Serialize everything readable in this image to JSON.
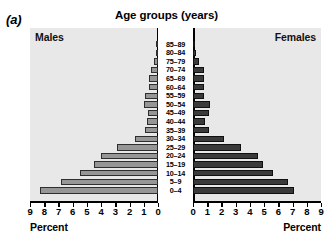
{
  "panel": {
    "tag": "(a)"
  },
  "header": {
    "title": "Age groups (years)",
    "left_label": "Males",
    "right_label": "Females"
  },
  "axes": {
    "left_axis_title": "Percent",
    "right_axis_title": "Percent",
    "left_ticklabels": [
      "9",
      "8",
      "7",
      "6",
      "5",
      "4",
      "3",
      "2",
      "1",
      "0"
    ],
    "right_ticklabels": [
      "0",
      "1",
      "2",
      "3",
      "4",
      "5",
      "6",
      "7",
      "8",
      "9"
    ],
    "max": 9
  },
  "colors": {
    "male_bar": "#969696",
    "female_bar": "#3a3a3a",
    "bar_outline": "#202020",
    "plot_background": "#e8e8e8",
    "center_strip": "#ffffff"
  },
  "chart_data": {
    "type": "bar",
    "title": "Age groups (years)",
    "subtype": "population-pyramid",
    "xlabel": "Percent",
    "ylabel": "Age groups (years)",
    "xlim": [
      0,
      9
    ],
    "grid": false,
    "legend": "none",
    "categories": [
      "85–89",
      "80–84",
      "75–79",
      "70–74",
      "65–69",
      "60–64",
      "55–59",
      "50–54",
      "45–49",
      "40–44",
      "35–39",
      "30–34",
      "25–29",
      "20–24",
      "15–19",
      "10–14",
      "5–9",
      "0–4"
    ],
    "series": [
      {
        "name": "Males",
        "side": "left",
        "values": [
          0.1,
          0.15,
          0.3,
          0.5,
          0.6,
          0.65,
          0.95,
          1.0,
          0.7,
          0.75,
          0.9,
          1.65,
          2.9,
          4.0,
          4.5,
          5.5,
          6.8,
          8.3
        ]
      },
      {
        "name": "Females",
        "side": "right",
        "values": [
          0.1,
          0.2,
          0.45,
          0.75,
          0.8,
          0.8,
          0.8,
          1.2,
          1.1,
          0.85,
          1.1,
          2.2,
          3.4,
          4.6,
          4.9,
          5.6,
          6.7,
          7.1
        ]
      }
    ]
  }
}
